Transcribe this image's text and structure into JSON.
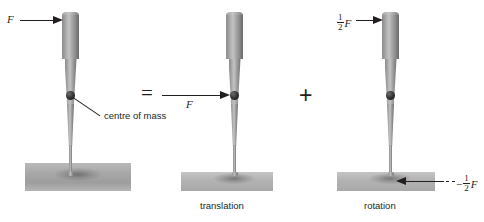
{
  "figure": {
    "top_cropped_text": "",
    "background_color": "#ffffff",
    "ink_color": "#231f20"
  },
  "panels": {
    "left": {
      "name": "applied force at top of bat",
      "force_label": "F",
      "com_label": "centre of mass",
      "caption": ""
    },
    "middle": {
      "name": "translation component",
      "force_label": "F",
      "caption": "translation"
    },
    "right": {
      "name": "rotation component",
      "force_top_label": {
        "sign": "",
        "numerator": "1",
        "denominator": "2",
        "symbol": "F"
      },
      "force_bottom_label": {
        "sign": "−",
        "numerator": "1",
        "denominator": "2",
        "symbol": "F"
      },
      "caption": "rotation"
    }
  },
  "operators": {
    "equals": "=",
    "plus": "+"
  },
  "colors": {
    "bat_light": "#c3c3c3",
    "bat_mid": "#9a9a9a",
    "bat_dark": "#6a6a6a",
    "ground": "#a8a8a8",
    "com_dot": "#1c1c1c"
  }
}
